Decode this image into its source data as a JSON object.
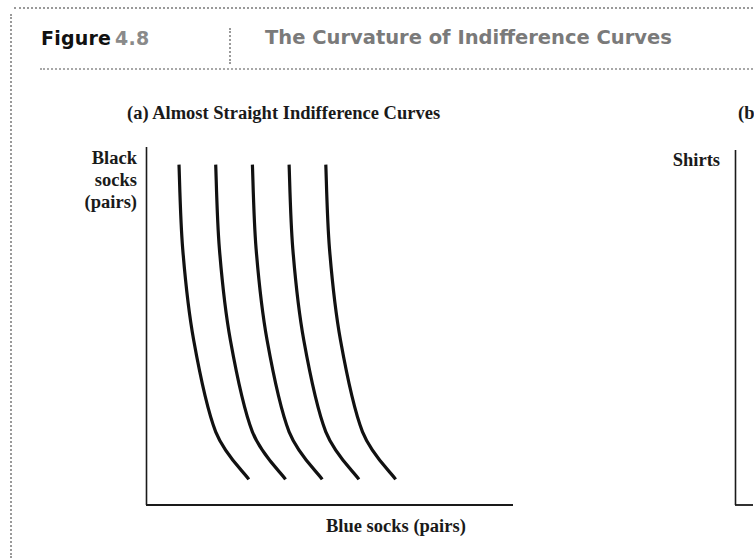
{
  "figure": {
    "label_word": "Figure",
    "label_number": "4.8",
    "title": "The Curvature of Indifference Curves"
  },
  "panels": [
    {
      "id": "a",
      "subtitle": "(a) Almost Straight Indifference Curves",
      "ylabel_lines": [
        "Black",
        "socks",
        "(pairs)"
      ],
      "xlabel": "Blue socks (pairs)"
    },
    {
      "id": "b",
      "subtitle": "(b",
      "ylabel_lines": [
        "Shirts"
      ],
      "xlabel": ""
    }
  ],
  "colors": {
    "ink": "#111111",
    "title_gray": "#7a7a7a",
    "number_gray": "#8a8a8a",
    "dotted_rule": "#9a9a9a"
  },
  "chart_data": [
    {
      "type": "line",
      "title": "(a) Almost Straight Indifference Curves",
      "xlabel": "Blue socks (pairs)",
      "ylabel": "Black socks (pairs)",
      "grid": false,
      "legend": null,
      "ticks": "none",
      "description": "Five nearly straight, steeply downward-sloping indifference curves, evenly spaced left to right, slightly convex toward the origin.",
      "series": [
        {
          "name": "IC1",
          "x": [
            0.09,
            0.1,
            0.13,
            0.19,
            0.28
          ],
          "y": [
            0.93,
            0.7,
            0.45,
            0.2,
            0.07
          ]
        },
        {
          "name": "IC2",
          "x": [
            0.19,
            0.2,
            0.23,
            0.29,
            0.38
          ],
          "y": [
            0.93,
            0.7,
            0.45,
            0.2,
            0.07
          ]
        },
        {
          "name": "IC3",
          "x": [
            0.29,
            0.3,
            0.33,
            0.39,
            0.48
          ],
          "y": [
            0.93,
            0.7,
            0.45,
            0.2,
            0.07
          ]
        },
        {
          "name": "IC4",
          "x": [
            0.39,
            0.4,
            0.43,
            0.49,
            0.58
          ],
          "y": [
            0.93,
            0.7,
            0.45,
            0.2,
            0.07
          ]
        },
        {
          "name": "IC5",
          "x": [
            0.49,
            0.5,
            0.53,
            0.59,
            0.68
          ],
          "y": [
            0.93,
            0.7,
            0.45,
            0.2,
            0.07
          ]
        }
      ],
      "xlim": [
        0,
        1
      ],
      "ylim": [
        0,
        1
      ]
    },
    {
      "type": "line",
      "title": "(b",
      "xlabel": "",
      "ylabel": "Shirts",
      "grid": false,
      "series": [],
      "note": "Panel truncated at right edge; only y-axis and label visible."
    }
  ]
}
